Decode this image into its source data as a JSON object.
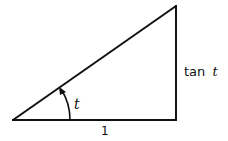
{
  "diagram": {
    "type": "right-triangle",
    "angle_label": "t",
    "opposite_label_prefix": "tan",
    "opposite_label_var": "t",
    "adjacent_label": "1",
    "stroke_color": "#111111",
    "background": "#ffffff"
  }
}
